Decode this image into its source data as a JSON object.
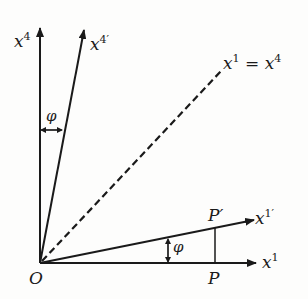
{
  "diagram": {
    "colors": {
      "ink": "#1a1a1a",
      "background": "#fdfdfc"
    },
    "origin_label": "O",
    "axes": {
      "x4": {
        "base": "x",
        "sup": "4"
      },
      "x4_prime": {
        "base": "x",
        "sup": "4′"
      },
      "x1": {
        "base": "x",
        "sup": "1"
      },
      "x1_prime": {
        "base": "x",
        "sup": "1′"
      }
    },
    "diagonal": {
      "lhs_base": "x",
      "lhs_sup": "1",
      "eq": "=",
      "rhs_base": "x",
      "rhs_sup": "4",
      "style": "dashed"
    },
    "points": {
      "P": "P",
      "P_prime": "P′"
    },
    "angles": {
      "upper": "φ",
      "lower": "φ"
    }
  }
}
